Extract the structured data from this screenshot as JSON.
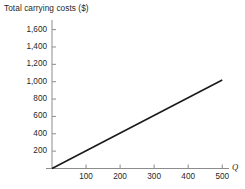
{
  "chart_data": {
    "type": "line",
    "title": "Total carrying costs ($)",
    "xlabel": "Q",
    "ylabel": "",
    "xlim": [
      0,
      535
    ],
    "ylim": [
      0,
      1700
    ],
    "grid": false,
    "legend": "none",
    "xticks": [
      100,
      200,
      300,
      400,
      500
    ],
    "xtick_labels": [
      "100",
      "200",
      "300",
      "400",
      "500"
    ],
    "yticks": [
      200,
      400,
      600,
      800,
      1000,
      1200,
      1400,
      1600
    ],
    "ytick_labels": [
      "200",
      "400",
      "600",
      "800",
      "1,000",
      "1,200",
      "1,400",
      "1,600"
    ],
    "series": [
      {
        "name": "Total carrying costs",
        "color": "#1a1a1a",
        "x": [
          0,
          500
        ],
        "values": [
          0,
          1020
        ]
      }
    ]
  },
  "colors": {
    "background": "#ffffff",
    "axis": "#8c8c8c",
    "line": "#1a1a1a",
    "text": "#1f1f1f"
  }
}
